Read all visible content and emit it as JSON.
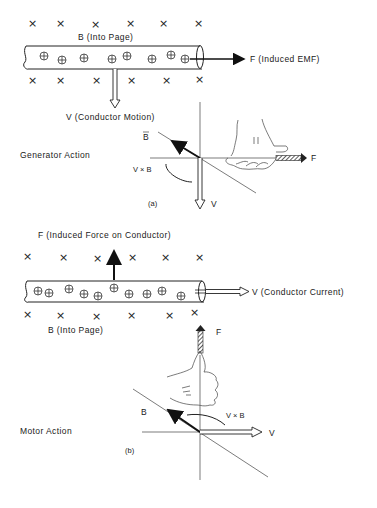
{
  "generator": {
    "field_label": "B (Into Page)",
    "force_label": "F (Induced EMF)",
    "motion_label": "V (Conductor Motion)",
    "action_label": "Generator Action",
    "vec_b": "B",
    "vec_cross": "V × B",
    "vec_v": "V",
    "vec_f": "F",
    "caption": "(a)"
  },
  "motor": {
    "force_label": "F (Induced Force on Conductor)",
    "current_label": "V (Conductor Current)",
    "field_label": "B (Into Page)",
    "action_label": "Motor Action",
    "vec_b": "B",
    "vec_cross": "V × B",
    "vec_v": "V",
    "vec_f": "F",
    "caption": "(b)"
  },
  "symbols": {
    "field_into_page": "×",
    "charge": "⊕"
  }
}
